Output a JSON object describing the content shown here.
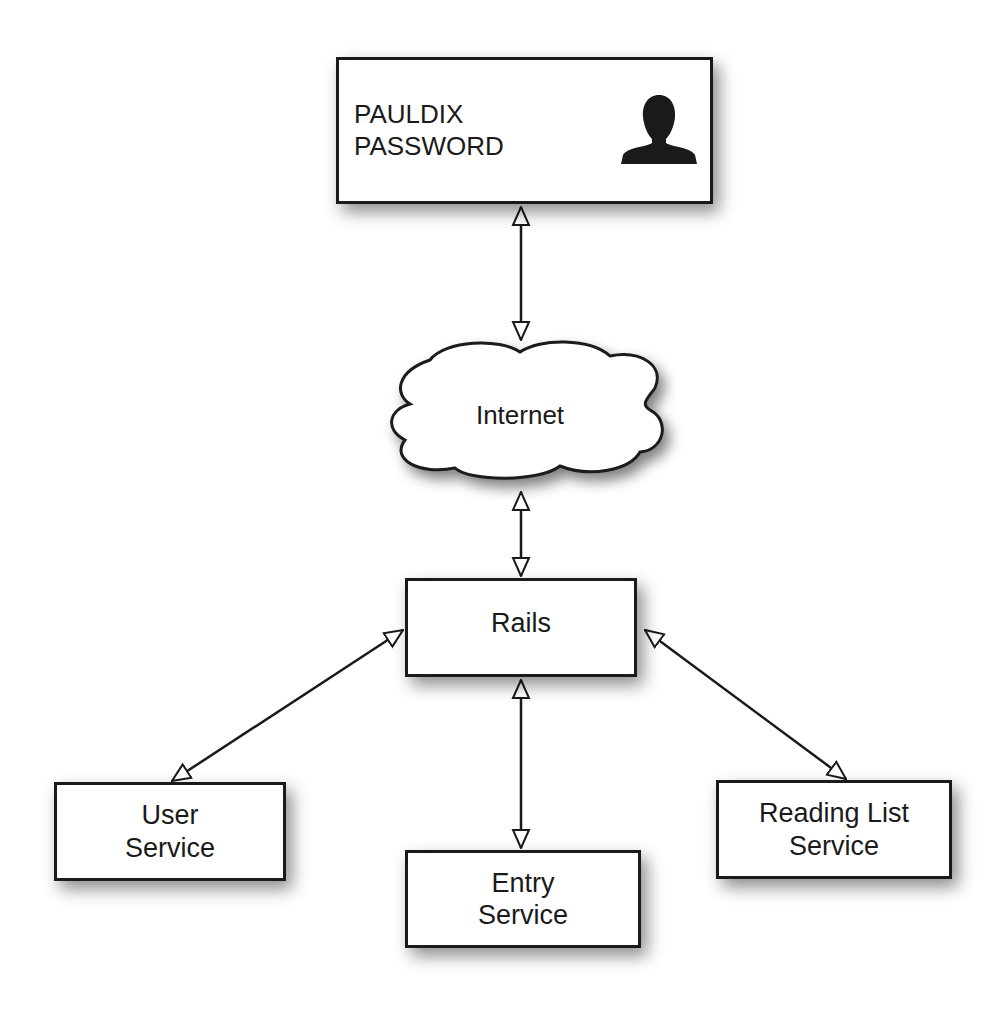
{
  "diagram": {
    "type": "architecture",
    "nodes": {
      "login": {
        "lines": [
          "PAULDIX",
          "PASSWORD"
        ],
        "icon": "person-silhouette-icon"
      },
      "internet": {
        "label": "Internet",
        "shape": "cloud"
      },
      "rails": {
        "label": "Rails"
      },
      "user_service": {
        "lines": [
          "User",
          "Service"
        ]
      },
      "entry_service": {
        "lines": [
          "Entry",
          "Service"
        ]
      },
      "reading_list_service": {
        "lines": [
          "Reading List",
          "Service"
        ]
      }
    },
    "edges": [
      {
        "from": "login",
        "to": "internet",
        "direction": "bidirectional"
      },
      {
        "from": "internet",
        "to": "rails",
        "direction": "bidirectional"
      },
      {
        "from": "rails",
        "to": "user_service",
        "direction": "bidirectional"
      },
      {
        "from": "rails",
        "to": "entry_service",
        "direction": "bidirectional"
      },
      {
        "from": "rails",
        "to": "reading_list_service",
        "direction": "bidirectional"
      }
    ],
    "colors": {
      "stroke": "#1a1a1a",
      "fill": "#ffffff",
      "shadow": "#808080"
    }
  }
}
